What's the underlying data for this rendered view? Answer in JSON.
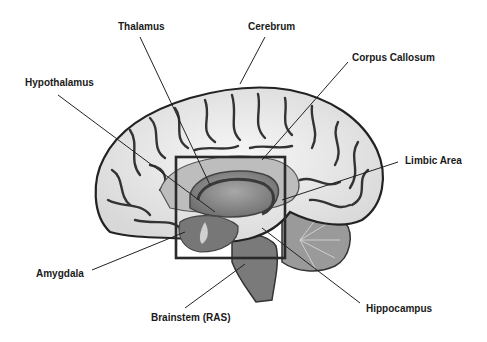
{
  "diagram": {
    "labels": {
      "thalamus": "Thalamus",
      "cerebrum": "Cerebrum",
      "corpus_callosum": "Corpus Callosum",
      "hypothalamus": "Hypothalamus",
      "limbic_area": "Limbic Area",
      "amygdala": "Amygdala",
      "brainstem": "Brainstem (RAS)",
      "hippocampus": "Hippocampus"
    },
    "highlight_box": {
      "label": "Limbic region box",
      "color": "#2a2a2a"
    },
    "colors": {
      "cortex": "#ececec",
      "sulci": "#3a3a3a",
      "inner": "#8a8a8a",
      "background": "#ffffff"
    }
  }
}
